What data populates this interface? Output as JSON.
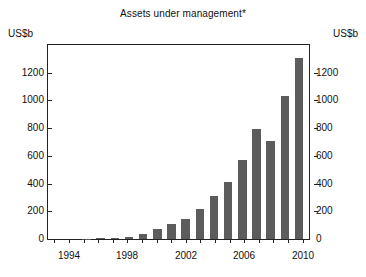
{
  "chart_data": {
    "type": "bar",
    "title": "Assets under management*",
    "xlabel": "",
    "ylabel": "US$b",
    "unit_left": "US$b",
    "unit_right": "US$b",
    "ylim": [
      0,
      1400
    ],
    "yticks": [
      0,
      200,
      400,
      600,
      800,
      1000,
      1200
    ],
    "ytick_labels": [
      "0",
      "200",
      "400",
      "600",
      "800",
      "1000",
      "1200"
    ],
    "xticks": [
      1994,
      1998,
      2002,
      2006,
      2010
    ],
    "xtick_labels": [
      "1994",
      "1998",
      "2002",
      "2006",
      "2010"
    ],
    "grid": false,
    "legend": null,
    "bar_color": "#5c5c5c",
    "categories": [
      "1993",
      "1994",
      "1995",
      "1996",
      "1997",
      "1998",
      "1999",
      "2000",
      "2001",
      "2002",
      "2003",
      "2004",
      "2005",
      "2006",
      "2007",
      "2008",
      "2009",
      "2010"
    ],
    "values": [
      0,
      0,
      3,
      5,
      10,
      15,
      38,
      72,
      105,
      142,
      215,
      310,
      412,
      568,
      797,
      710,
      1035,
      1305
    ]
  }
}
